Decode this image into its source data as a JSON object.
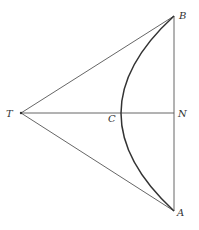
{
  "diagram": {
    "type": "geometry",
    "colors": {
      "line": "#555555",
      "arc": "#333333",
      "background": "#ffffff",
      "label": "#333333"
    },
    "points": {
      "T": {
        "label": "T",
        "x": 21,
        "y": 113
      },
      "B": {
        "label": "B",
        "x": 174,
        "y": 16
      },
      "A": {
        "label": "A",
        "x": 174,
        "y": 211
      },
      "N": {
        "label": "N",
        "x": 174,
        "y": 113
      },
      "C": {
        "label": "C",
        "x": 121,
        "y": 113
      }
    },
    "segments": [
      {
        "name": "TB",
        "from": "T",
        "to": "B"
      },
      {
        "name": "TA",
        "from": "T",
        "to": "A"
      },
      {
        "name": "TN",
        "from": "T",
        "to": "N"
      },
      {
        "name": "BA",
        "from": "B",
        "to": "A"
      }
    ],
    "arcs": [
      {
        "name": "BCA",
        "from": "B",
        "through": "C",
        "to": "A"
      }
    ],
    "labels": {
      "T": "T",
      "B": "B",
      "A": "A",
      "N": "N",
      "C": "C"
    }
  }
}
